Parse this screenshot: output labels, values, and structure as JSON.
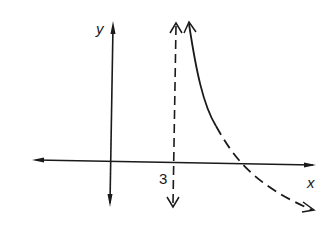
{
  "diagram": {
    "type": "function-graph",
    "axes": {
      "x_label": "x",
      "y_label": "y"
    },
    "annotations": {
      "asymptote_label": "3"
    },
    "colors": {
      "stroke": "#1a1a1a",
      "background": "#ffffff"
    }
  }
}
